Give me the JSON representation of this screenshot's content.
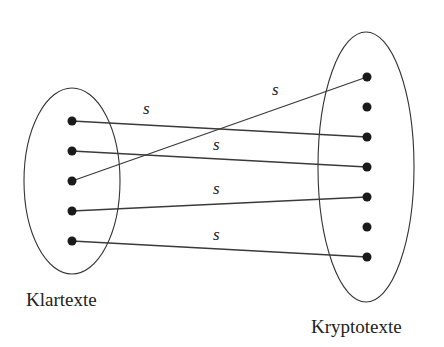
{
  "diagram": {
    "type": "mapping",
    "left_set": {
      "label": "Klartexte",
      "ellipse": {
        "cx": 72,
        "cy": 181,
        "rx": 48,
        "ry": 93
      },
      "label_pos": {
        "x": 26,
        "y": 306
      },
      "points": [
        {
          "x": 72,
          "y": 121
        },
        {
          "x": 72,
          "y": 151
        },
        {
          "x": 72,
          "y": 181
        },
        {
          "x": 72,
          "y": 211
        },
        {
          "x": 72,
          "y": 241
        }
      ]
    },
    "right_set": {
      "label": "Kryptotexte",
      "ellipse": {
        "cx": 366,
        "cy": 167,
        "rx": 48,
        "ry": 135
      },
      "label_pos": {
        "x": 311,
        "y": 333
      },
      "points": [
        {
          "x": 367,
          "y": 77
        },
        {
          "x": 367,
          "y": 107
        },
        {
          "x": 367,
          "y": 137
        },
        {
          "x": 367,
          "y": 167
        },
        {
          "x": 367,
          "y": 197
        },
        {
          "x": 367,
          "y": 227
        },
        {
          "x": 367,
          "y": 257
        }
      ]
    },
    "edges": [
      {
        "from": 0,
        "to": 2,
        "label": "s",
        "label_pos": {
          "x": 143,
          "y": 114
        }
      },
      {
        "from": 1,
        "to": 3,
        "label": "s",
        "label_pos": {
          "x": 213,
          "y": 150
        }
      },
      {
        "from": 2,
        "to": 0,
        "label": "s",
        "label_pos": {
          "x": 272,
          "y": 95
        }
      },
      {
        "from": 3,
        "to": 4,
        "label": "s",
        "label_pos": {
          "x": 213,
          "y": 194
        }
      },
      {
        "from": 4,
        "to": 6,
        "label": "s",
        "label_pos": {
          "x": 213,
          "y": 240
        }
      }
    ],
    "colors": {
      "stroke": "#333333",
      "point": "#1a1a1a",
      "background": "#ffffff"
    }
  }
}
